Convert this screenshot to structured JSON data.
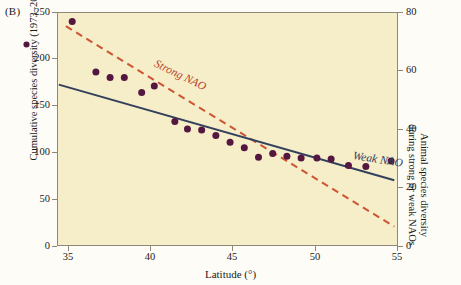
{
  "panel": {
    "label": "(B)"
  },
  "axes": {
    "x": {
      "title": "Latitude (°)",
      "ticks": [
        "35",
        "40",
        "45",
        "50",
        "55"
      ],
      "min": 33.9,
      "max": 55.5
    },
    "y_left": {
      "title": "Cumulative species diversity (1973–2003) (●)",
      "ticks": [
        "250",
        "200",
        "150",
        "100",
        "50",
        "0"
      ],
      "min": 0,
      "max": 250
    },
    "y_right": {
      "title_line1": "Animal species diversity",
      "title_line2": "during strong or weak NAOs",
      "ticks": [
        "80",
        "60",
        "40",
        "20",
        "0"
      ],
      "min": 0,
      "max": 80
    }
  },
  "colors": {
    "plot_background": "#f6edc9",
    "frame": "#8d8878",
    "scatter": "#54173f",
    "strong_nao": "#cc5533",
    "weak_nao": "#33405c",
    "text": "#1a1a1a"
  },
  "annotations": {
    "strong_nao_label": "Strong NAO",
    "weak_nao_label": "Weak NAO"
  },
  "chart_data": {
    "type": "scatter",
    "title": "",
    "xlabel": "Latitude (°)",
    "ylabel": "Cumulative species diversity (1973–2003)",
    "ylabel_secondary": "Animal species diversity during strong or weak NAOs",
    "xlim": [
      33.9,
      55.5
    ],
    "ylim": [
      0,
      250
    ],
    "ylim_secondary": [
      0,
      80
    ],
    "grid": false,
    "legend_position": "inline-annotations",
    "series": [
      {
        "name": "Cumulative species diversity (1973–2003)",
        "type": "scatter",
        "axis": "left",
        "marker": "filled-circle",
        "color": "#54173f",
        "points": [
          {
            "x": 34.8,
            "y": 241
          },
          {
            "x": 36.3,
            "y": 187
          },
          {
            "x": 37.2,
            "y": 181
          },
          {
            "x": 38.1,
            "y": 181
          },
          {
            "x": 39.2,
            "y": 165
          },
          {
            "x": 40.0,
            "y": 172
          },
          {
            "x": 41.3,
            "y": 134
          },
          {
            "x": 42.1,
            "y": 126
          },
          {
            "x": 43.0,
            "y": 125
          },
          {
            "x": 43.9,
            "y": 119
          },
          {
            "x": 44.8,
            "y": 112
          },
          {
            "x": 45.7,
            "y": 106
          },
          {
            "x": 46.6,
            "y": 96
          },
          {
            "x": 47.5,
            "y": 100
          },
          {
            "x": 48.4,
            "y": 97
          },
          {
            "x": 49.3,
            "y": 95
          },
          {
            "x": 50.3,
            "y": 95
          },
          {
            "x": 51.2,
            "y": 94
          },
          {
            "x": 52.3,
            "y": 87
          },
          {
            "x": 53.4,
            "y": 86
          },
          {
            "x": 55.0,
            "y": 92
          }
        ]
      },
      {
        "name": "Strong NAO",
        "type": "line",
        "style": "dashed",
        "axis": "right",
        "color": "#cc5533",
        "endpoints": [
          {
            "x": 34.4,
            "y_right": 75.5
          },
          {
            "x": 55.2,
            "y_right": 7.0
          }
        ]
      },
      {
        "name": "Weak NAO",
        "type": "line",
        "style": "solid",
        "axis": "right",
        "color": "#33405c",
        "endpoints": [
          {
            "x": 33.95,
            "y_right": 55.5
          },
          {
            "x": 55.2,
            "y_right": 22.8
          }
        ]
      }
    ]
  }
}
